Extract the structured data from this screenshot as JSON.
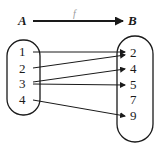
{
  "diagram": {
    "type": "function-mapping",
    "domain_set": {
      "name": "A",
      "elements": [
        "1",
        "2",
        "3",
        "4"
      ]
    },
    "codomain_set": {
      "name": "B",
      "elements": [
        "2",
        "4",
        "5",
        "7",
        "9"
      ]
    },
    "function_label": "f",
    "mappings": [
      {
        "from": "1",
        "to": "2"
      },
      {
        "from": "2",
        "to": "2"
      },
      {
        "from": "3",
        "to": "4"
      },
      {
        "from": "3",
        "to": "5"
      },
      {
        "from": "4",
        "to": "9"
      }
    ]
  }
}
